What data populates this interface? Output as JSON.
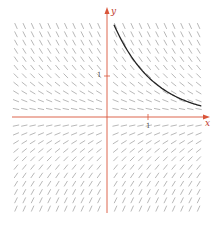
{
  "diagram": {
    "type": "slope-field",
    "equation": "dy/dx = -y",
    "axes": {
      "x_label": "x",
      "y_label": "y",
      "x_tick_label": "1",
      "y_tick_label": "1",
      "axis_color": "#d9553a"
    },
    "field": {
      "x_range": [
        -2.25,
        2.3
      ],
      "y_range": [
        -2.3,
        2.25
      ],
      "spacing": 0.2,
      "segment_color": "#9a9a9a"
    },
    "solution_curve": {
      "description": "y = C·e^(-x) passing through (1, 0.55)",
      "color": "#222222",
      "x_start": 0.17,
      "x_end": 2.3
    }
  }
}
